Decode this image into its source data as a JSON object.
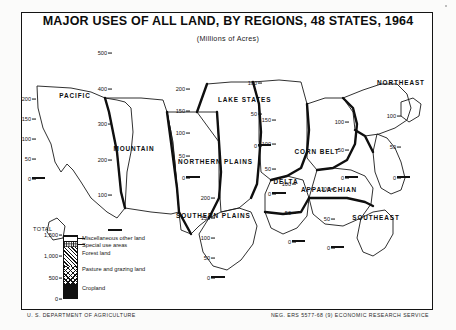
{
  "header": {
    "title": "MAJOR USES OF ALL LAND, BY REGIONS, 48 STATES, 1964",
    "subtitle": "(Millions of Acres)"
  },
  "footer": {
    "agency": "U. S. DEPARTMENT OF AGRICULTURE",
    "credit": "NEG. ERS 5577-68 (9)   ECONOMIC RESEARCH SERVICE"
  },
  "legend": {
    "total_label": "TOTAL",
    "ticks": [
      "1,500",
      "1,000",
      "500",
      "0"
    ],
    "items": [
      {
        "label": "Miscellaneous other land",
        "key": "misc"
      },
      {
        "label": "Special use areas",
        "key": "special"
      },
      {
        "label": "Forest land",
        "key": "forest"
      },
      {
        "label": "Pasture and grazing land",
        "key": "pasture"
      },
      {
        "label": "Cropland",
        "key": "cropland"
      }
    ]
  },
  "chart_data": {
    "type": "bar",
    "title": "MAJOR USES OF ALL LAND, BY REGIONS, 48 STATES, 1964",
    "subtitle": "(Millions of Acres)",
    "xlabel": "",
    "ylabel": "Millions of Acres",
    "grid": false,
    "legend_position": "bottom-left",
    "stacked": true,
    "series": [
      {
        "name": "Cropland",
        "key": "cropland"
      },
      {
        "name": "Pasture and grazing land",
        "key": "pasture"
      },
      {
        "name": "Forest land",
        "key": "forest"
      },
      {
        "name": "Special use areas",
        "key": "special"
      },
      {
        "name": "Miscellaneous other land",
        "key": "misc"
      }
    ],
    "regions": [
      {
        "name": "PACIFIC",
        "ymax": 200,
        "ystep": 50,
        "ticks": [
          "200",
          "150",
          "100",
          "50",
          "0"
        ],
        "values": {
          "cropland": 22,
          "pasture": 62,
          "forest": 76,
          "special": 22,
          "misc": 18
        },
        "total": 200
      },
      {
        "name": "MOUNTAIN",
        "ymax": 550,
        "ystep": 100,
        "ticks": [
          "500",
          "400",
          "300",
          "200",
          "100"
        ],
        "values": {
          "cropland": 44,
          "pasture": 298,
          "forest": 141,
          "special": 42,
          "misc": 16
        },
        "total": 541
      },
      {
        "name": "NORTHERN PLAINS",
        "ymax": 200,
        "ystep": 50,
        "ticks": [
          "200",
          "150",
          "100",
          "50",
          "0"
        ],
        "values": {
          "cropland": 98,
          "pasture": 73,
          "forest": 5,
          "special": 12,
          "misc": 6
        },
        "total": 194
      },
      {
        "name": "LAKE STATES",
        "ymax": 100,
        "ystep": 50,
        "ticks": [
          "100",
          "50",
          "0"
        ],
        "values": {
          "cropland": 42,
          "pasture": 12,
          "forest": 36,
          "special": 7,
          "misc": 4
        },
        "total": 101
      },
      {
        "name": "CORN BELT",
        "ymax": 150,
        "ystep": 50,
        "ticks": [
          "150",
          "100",
          "50",
          "0"
        ],
        "values": {
          "cropland": 94,
          "pasture": 37,
          "forest": 13,
          "special": 9,
          "misc": 2
        },
        "total": 155
      },
      {
        "name": "SOUTHERN PLAINS",
        "ymax": 200,
        "ystep": 50,
        "ticks": [
          "200",
          "150",
          "100",
          "50",
          "0"
        ],
        "values": {
          "cropland": 38,
          "pasture": 118,
          "forest": 24,
          "special": 12,
          "misc": 5
        },
        "total": 197
      },
      {
        "name": "DELTA",
        "ymax": 100,
        "ystep": 50,
        "ticks": [
          "100",
          "50",
          "0"
        ],
        "values": {
          "cropland": 22,
          "pasture": 16,
          "forest": 48,
          "special": 5,
          "misc": 4
        },
        "total": 95
      },
      {
        "name": "APPALACHIAN",
        "ymax": 100,
        "ystep": 50,
        "ticks": [
          "100",
          "50",
          "0"
        ],
        "values": {
          "cropland": 23,
          "pasture": 19,
          "forest": 51,
          "special": 7,
          "misc": 2
        },
        "total": 102
      },
      {
        "name": "SOUTHEAST",
        "ymax": 100,
        "ystep": 50,
        "ticks": [
          "100",
          "50",
          "0"
        ],
        "values": {
          "cropland": 17,
          "pasture": 13,
          "forest": 58,
          "special": 8,
          "misc": 4
        },
        "total": 100
      },
      {
        "name": "NORTHEAST",
        "ymax": 100,
        "ystep": 50,
        "ticks": [
          "100",
          "50",
          "0"
        ],
        "values": {
          "cropland": 16,
          "pasture": 13,
          "forest": 55,
          "special": 12,
          "misc": 4
        },
        "total": 100
      }
    ]
  }
}
